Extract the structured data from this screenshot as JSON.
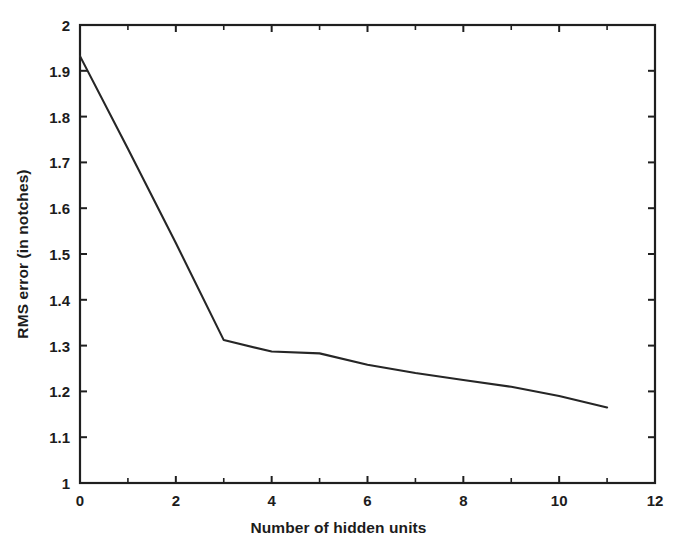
{
  "chart_data": {
    "type": "line",
    "title": "",
    "xlabel": "Number of hidden units",
    "ylabel": "RMS error (in notches)",
    "xlim": [
      0,
      12
    ],
    "ylim": [
      1,
      2
    ],
    "grid": false,
    "legend": null,
    "x_ticks": [
      0,
      2,
      4,
      6,
      8,
      10,
      12
    ],
    "x_tick_labels": [
      "0",
      "2",
      "4",
      "6",
      "8",
      "10",
      "12"
    ],
    "x_minor_ticks": [
      1,
      3,
      5,
      7,
      9,
      11
    ],
    "y_ticks": [
      1,
      1.1,
      1.2,
      1.3,
      1.4,
      1.5,
      1.6,
      1.7,
      1.8,
      1.9,
      2
    ],
    "y_tick_labels": [
      "1",
      "1.1",
      "1.2",
      "1.3",
      "1.4",
      "1.5",
      "1.6",
      "1.7",
      "1.8",
      "1.9",
      "2"
    ],
    "series": [
      {
        "name": "RMS error",
        "color": "#262626",
        "x": [
          0,
          1,
          2,
          3,
          4,
          5,
          6,
          7,
          8,
          9,
          10,
          11
        ],
        "values": [
          1.932,
          1.73,
          1.524,
          1.312,
          1.287,
          1.283,
          1.258,
          1.24,
          1.225,
          1.21,
          1.19,
          1.165
        ]
      }
    ]
  },
  "figure": {
    "axis_color": "#1f1f1f",
    "background": "#ffffff"
  }
}
